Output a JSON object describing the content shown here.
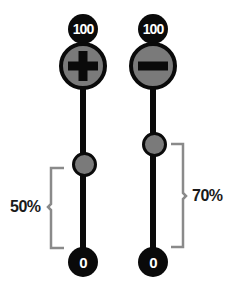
{
  "colors": {
    "track": "#0a0a0a",
    "knob_fill": "#7a7a7a",
    "bracket": "#8a8a8a",
    "text": "#1a1a1a"
  },
  "sliders": [
    {
      "name": "increase",
      "button_icon": "plus-icon",
      "max_label": "100",
      "min_label": "0",
      "value_percent": 50,
      "value_label": "50%"
    },
    {
      "name": "decrease",
      "button_icon": "minus-icon",
      "max_label": "100",
      "min_label": "0",
      "value_percent": 70,
      "value_label": "70%"
    }
  ]
}
